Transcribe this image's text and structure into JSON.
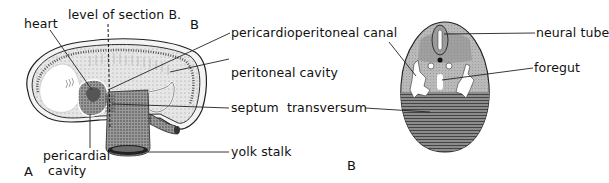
{
  "figure": {
    "panel_a": {
      "letter": "A",
      "top_letter": "B",
      "labels": {
        "heart": "heart",
        "level_of_section": "level of section B.",
        "pericardioperitoneal_canal": "pericardioperitoneal canal",
        "peritoneal_cavity": "peritoneal cavity",
        "septum_transversum": "septum  transversum",
        "yolk_stalk": "yolk stalk",
        "pericardial": "pericardial",
        "cavity": "cavity"
      }
    },
    "panel_b": {
      "letter": "B",
      "labels": {
        "neural_tube": "neural tube",
        "foregut": "foregut"
      }
    }
  }
}
